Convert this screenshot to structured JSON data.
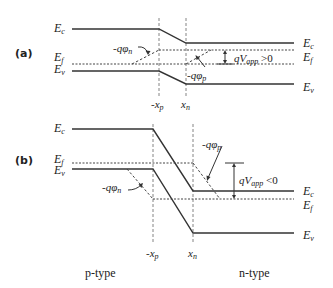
{
  "figure": {
    "panels": [
      {
        "id": "a",
        "label": "(a)",
        "left_labels": {
          "ec": "E",
          "ec_sub": "c",
          "ef": "E",
          "ef_sub": "f",
          "ev": "E",
          "ev_sub": "v"
        },
        "right_labels": {
          "ec": "E",
          "ec_sub": "c",
          "ef": "E",
          "ef_sub": "f",
          "ev": "E",
          "ev_sub": "v"
        },
        "phi_n": {
          "prefix": "-qφ",
          "sub": "n"
        },
        "phi_p": {
          "prefix": "-qφ",
          "sub": "p"
        },
        "vapp": {
          "prefix": "qV",
          "sub": "app",
          "suffix": " >0"
        },
        "xp": {
          "prefix": "-x",
          "sub": "p"
        },
        "xn": {
          "prefix": "x",
          "sub": "n"
        }
      },
      {
        "id": "b",
        "label": "(b)",
        "left_labels": {
          "ec": "E",
          "ec_sub": "c",
          "ef": "E",
          "ef_sub": "f",
          "ev": "E",
          "ev_sub": "v"
        },
        "right_labels": {
          "ec": "E",
          "ec_sub": "c",
          "ef": "E",
          "ef_sub": "f",
          "ev": "E",
          "ev_sub": "v"
        },
        "phi_n": {
          "prefix": "-qφ",
          "sub": "n"
        },
        "phi_p": {
          "prefix": "-qφ",
          "sub": "p"
        },
        "vapp": {
          "prefix": "qV",
          "sub": "app",
          "suffix": " <0"
        },
        "xp": {
          "prefix": "-x",
          "sub": "p"
        },
        "xn": {
          "prefix": "x",
          "sub": "n"
        }
      }
    ],
    "regions": {
      "p": "p-type",
      "n": "n-type"
    }
  }
}
